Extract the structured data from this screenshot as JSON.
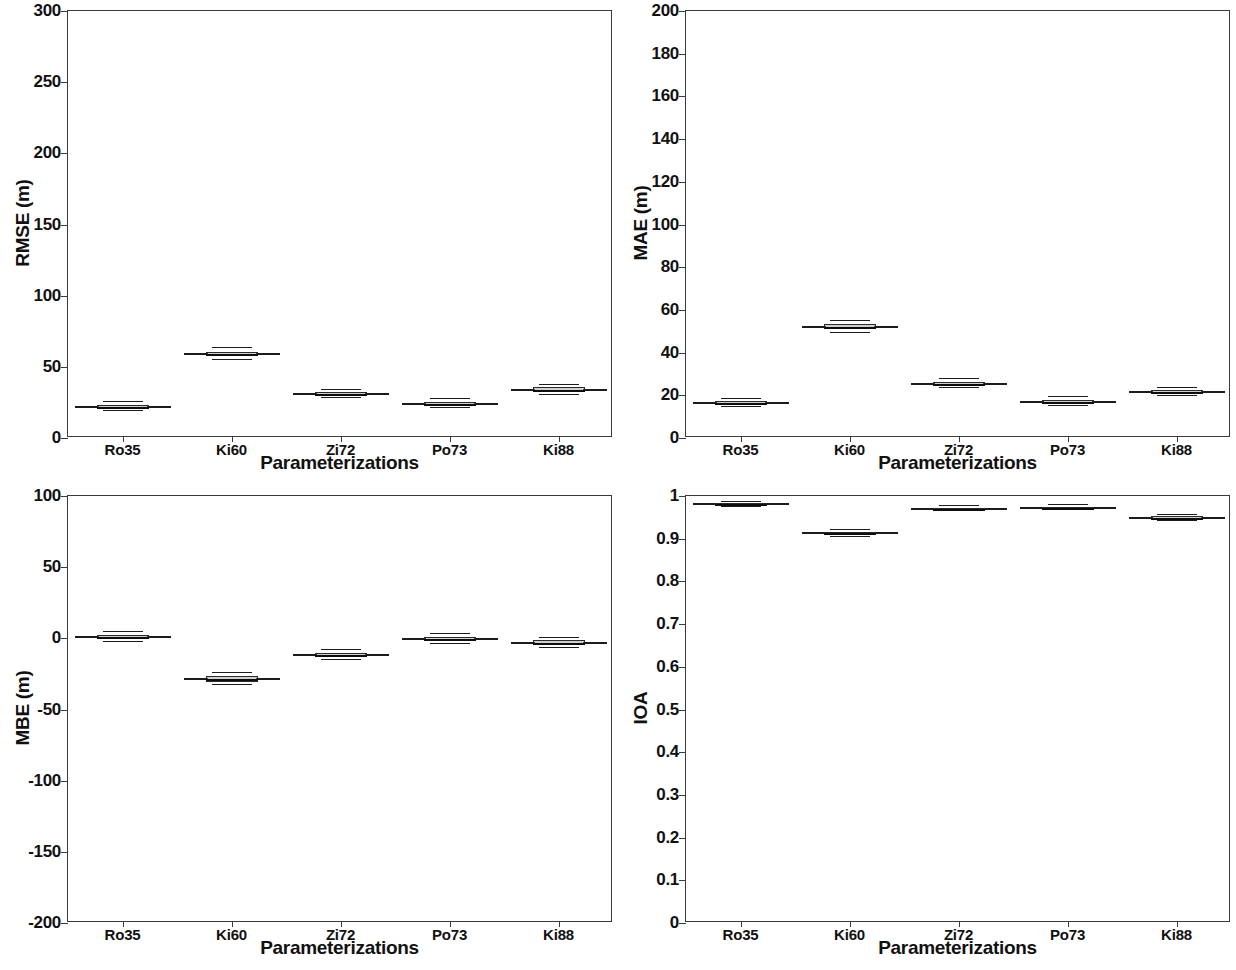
{
  "figure": {
    "layout": "2x2 grid of boxplot panels",
    "background_color": "#ffffff",
    "line_color": "#1c1c1c",
    "box_fill_color": "#787878"
  },
  "categories": [
    "Ro35",
    "Ki60",
    "Zi72",
    "Po73",
    "Ki88"
  ],
  "xlabel": "Parameterizations",
  "panels": [
    {
      "id": "rmse",
      "ylabel": "RMSE (m)",
      "xlabel": "Parameterizations",
      "yticks": [
        "0",
        "50",
        "100",
        "150",
        "200",
        "250",
        "300"
      ]
    },
    {
      "id": "mae",
      "ylabel": "MAE (m)",
      "xlabel": "Parameterizations",
      "yticks": [
        "0",
        "20",
        "40",
        "60",
        "80",
        "100",
        "120",
        "140",
        "160",
        "180",
        "200"
      ]
    },
    {
      "id": "mbe",
      "ylabel": "MBE (m)",
      "xlabel": "Parameterizations",
      "yticks": [
        "-200",
        "-150",
        "-100",
        "-50",
        "0",
        "50",
        "100"
      ]
    },
    {
      "id": "ioa",
      "ylabel": "IOA",
      "xlabel": "Parameterizations",
      "yticks": [
        "0",
        "0.1",
        "0.2",
        "0.3",
        "0.4",
        "0.5",
        "0.6",
        "0.7",
        "0.8",
        "0.9",
        "1"
      ]
    }
  ],
  "chart_data": [
    {
      "type": "box",
      "id": "rmse",
      "title": "",
      "xlabel": "Parameterizations",
      "ylabel": "RMSE (m)",
      "categories": [
        "Ro35",
        "Ki60",
        "Zi72",
        "Po73",
        "Ki88"
      ],
      "ylim": [
        0,
        300
      ],
      "ytick_values": [
        0,
        50,
        100,
        150,
        200,
        250,
        300
      ],
      "grid": false,
      "legend": "none",
      "boxes": [
        {
          "category": "Ro35",
          "whisker_low": 19.0,
          "q1": 21.0,
          "median": 22.0,
          "q3": 23.0,
          "whisker_high": 25.5
        },
        {
          "category": "Ki60",
          "whisker_low": 55.0,
          "q1": 57.5,
          "median": 59.0,
          "q3": 60.5,
          "whisker_high": 63.0
        },
        {
          "category": "Zi72",
          "whisker_low": 28.0,
          "q1": 30.0,
          "median": 31.0,
          "q3": 32.0,
          "whisker_high": 34.0
        },
        {
          "category": "Po73",
          "whisker_low": 21.0,
          "q1": 23.0,
          "median": 24.0,
          "q3": 25.5,
          "whisker_high": 27.5
        },
        {
          "category": "Ki88",
          "whisker_low": 30.5,
          "q1": 32.5,
          "median": 34.0,
          "q3": 35.5,
          "whisker_high": 37.5
        }
      ]
    },
    {
      "type": "box",
      "id": "mae",
      "title": "",
      "xlabel": "Parameterizations",
      "ylabel": "MAE (m)",
      "categories": [
        "Ro35",
        "Ki60",
        "Zi72",
        "Po73",
        "Ki88"
      ],
      "ylim": [
        0,
        200
      ],
      "ytick_values": [
        0,
        20,
        40,
        60,
        80,
        100,
        120,
        140,
        160,
        180,
        200
      ],
      "grid": false,
      "legend": "none",
      "boxes": [
        {
          "category": "Ro35",
          "whisker_low": 14.5,
          "q1": 15.8,
          "median": 16.5,
          "q3": 17.2,
          "whisker_high": 18.5
        },
        {
          "category": "Ki60",
          "whisker_low": 49.0,
          "q1": 51.0,
          "median": 52.0,
          "q3": 53.2,
          "whisker_high": 55.0
        },
        {
          "category": "Zi72",
          "whisker_low": 23.5,
          "q1": 24.8,
          "median": 25.5,
          "q3": 26.3,
          "whisker_high": 27.5
        },
        {
          "category": "Po73",
          "whisker_low": 15.2,
          "q1": 16.4,
          "median": 17.0,
          "q3": 17.7,
          "whisker_high": 19.0
        },
        {
          "category": "Ki88",
          "whisker_low": 19.5,
          "q1": 20.8,
          "median": 21.5,
          "q3": 22.3,
          "whisker_high": 23.5
        }
      ]
    },
    {
      "type": "box",
      "id": "mbe",
      "title": "",
      "xlabel": "Parameterizations",
      "ylabel": "MBE (m)",
      "categories": [
        "Ro35",
        "Ki60",
        "Zi72",
        "Po73",
        "Ki88"
      ],
      "ylim": [
        -200,
        100
      ],
      "ytick_values": [
        -200,
        -150,
        -100,
        -50,
        0,
        50,
        100
      ],
      "grid": false,
      "legend": "none",
      "boxes": [
        {
          "category": "Ro35",
          "whisker_low": -2.5,
          "q1": -0.5,
          "median": 1.0,
          "q3": 2.5,
          "whisker_high": 4.5
        },
        {
          "category": "Ki60",
          "whisker_low": -32.5,
          "q1": -30.5,
          "median": -28.5,
          "q3": -26.5,
          "whisker_high": -24.5
        },
        {
          "category": "Zi72",
          "whisker_low": -15.0,
          "q1": -13.0,
          "median": -11.5,
          "q3": -10.0,
          "whisker_high": -8.0
        },
        {
          "category": "Po73",
          "whisker_low": -4.0,
          "q1": -2.0,
          "median": -0.5,
          "q3": 1.0,
          "whisker_high": 3.0
        },
        {
          "category": "Ki88",
          "whisker_low": -6.5,
          "q1": -4.5,
          "median": -3.0,
          "q3": -1.5,
          "whisker_high": 0.5
        }
      ]
    },
    {
      "type": "box",
      "id": "ioa",
      "title": "",
      "xlabel": "Parameterizations",
      "ylabel": "IOA",
      "categories": [
        "Ro35",
        "Ki60",
        "Zi72",
        "Po73",
        "Ki88"
      ],
      "ylim": [
        0,
        1
      ],
      "ytick_values": [
        0,
        0.1,
        0.2,
        0.3,
        0.4,
        0.5,
        0.6,
        0.7,
        0.8,
        0.9,
        1
      ],
      "grid": false,
      "legend": "none",
      "boxes": [
        {
          "category": "Ro35",
          "whisker_low": 0.975,
          "q1": 0.979,
          "median": 0.981,
          "q3": 0.983,
          "whisker_high": 0.987
        },
        {
          "category": "Ki60",
          "whisker_low": 0.905,
          "q1": 0.91,
          "median": 0.913,
          "q3": 0.916,
          "whisker_high": 0.921
        },
        {
          "category": "Zi72",
          "whisker_low": 0.964,
          "q1": 0.968,
          "median": 0.97,
          "q3": 0.972,
          "whisker_high": 0.976
        },
        {
          "category": "Po73",
          "whisker_low": 0.967,
          "q1": 0.971,
          "median": 0.973,
          "q3": 0.975,
          "whisker_high": 0.979
        },
        {
          "category": "Ki88",
          "whisker_low": 0.942,
          "q1": 0.946,
          "median": 0.949,
          "q3": 0.952,
          "whisker_high": 0.956
        }
      ]
    }
  ]
}
